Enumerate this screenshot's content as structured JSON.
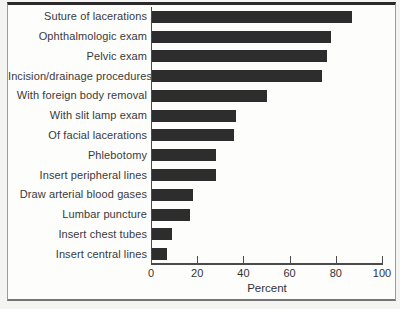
{
  "chart_data": {
    "type": "bar",
    "orientation": "horizontal",
    "xlabel": "Percent",
    "xlim": [
      0,
      100
    ],
    "xticks": [
      0,
      20,
      40,
      60,
      80,
      100
    ],
    "grid": false,
    "bar_color": "#2d2d2d",
    "categories": [
      "Suture of lacerations",
      "Ophthalmologic exam",
      "Pelvic exam",
      "Incision/drainage procedures",
      "With foreign body removal",
      "With slit lamp exam",
      "Of facial lacerations",
      "Phlebotomy",
      "Insert peripheral lines",
      "Draw arterial blood gases",
      "Lumbar puncture",
      "Insert chest tubes",
      "Insert central lines"
    ],
    "values": [
      87,
      78,
      76,
      74,
      50,
      37,
      36,
      28,
      28,
      18,
      17,
      9,
      7
    ]
  },
  "colors": {
    "frame_top": "#2a2a2a",
    "frame_sides": "#9c9c9c",
    "axis": "#4a4a4a",
    "text": "#3a3a3a",
    "figure_background": "#fdfdfc",
    "page_background": "#f4f4f2"
  }
}
